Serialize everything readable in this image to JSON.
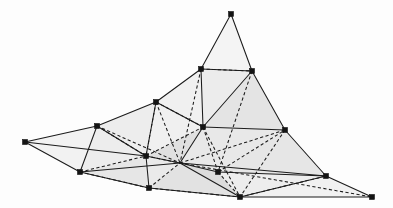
{
  "figure": {
    "canvas": {
      "width": 393,
      "height": 208
    },
    "style": {
      "background_color": "#fdfdfd",
      "face_fill_light": "#f4f4f4",
      "face_fill_mid": "#ebebeb",
      "face_fill_dark": "#e0e0e0",
      "face_fill_deep": "#d6d6d6",
      "edge_color": "#1b1b1b",
      "vertex_color": "#141414",
      "vertex_marker_shape": "square",
      "vertex_marker_size": 5,
      "visible_edge_style": "solid",
      "hidden_edge_style": "dashed"
    }
  },
  "chart_data": {
    "type": "scatter",
    "xlabel": "",
    "ylabel": "",
    "xlim": [
      0,
      393
    ],
    "ylim": [
      208,
      0
    ],
    "grid": false,
    "legend": "none",
    "vertices": [
      {
        "id": "v0",
        "label": "left-tip",
        "x": 25,
        "y": 142,
        "marked": true
      },
      {
        "id": "v1",
        "label": "upper-left",
        "x": 97,
        "y": 126,
        "marked": true
      },
      {
        "id": "v2",
        "label": "lower-left",
        "x": 80,
        "y": 172,
        "marked": true
      },
      {
        "id": "v3",
        "label": "ridge-left",
        "x": 156,
        "y": 102,
        "marked": true
      },
      {
        "id": "v4",
        "label": "mid-left",
        "x": 146,
        "y": 156,
        "marked": true
      },
      {
        "id": "v5",
        "label": "bottom-left",
        "x": 149,
        "y": 188,
        "marked": true
      },
      {
        "id": "v6",
        "label": "peak-left-base",
        "x": 201,
        "y": 69,
        "marked": true
      },
      {
        "id": "v7",
        "label": "apex",
        "x": 231,
        "y": 14,
        "marked": true
      },
      {
        "id": "v8",
        "label": "peak-right-base",
        "x": 252,
        "y": 71,
        "marked": true
      },
      {
        "id": "v9",
        "label": "center",
        "x": 203,
        "y": 127,
        "marked": true
      },
      {
        "id": "v10",
        "label": "hub",
        "x": 180,
        "y": 163,
        "marked": false
      },
      {
        "id": "v11",
        "label": "mid-right",
        "x": 218,
        "y": 172,
        "marked": true
      },
      {
        "id": "v12",
        "label": "bottom-center",
        "x": 240,
        "y": 197,
        "marked": true
      },
      {
        "id": "v13",
        "label": "right-upper",
        "x": 285,
        "y": 130,
        "marked": true
      },
      {
        "id": "v14",
        "label": "right-lower",
        "x": 326,
        "y": 176,
        "marked": true
      },
      {
        "id": "v15",
        "label": "right-tip",
        "x": 372,
        "y": 197,
        "marked": true
      }
    ],
    "faces": [
      {
        "id": "f0",
        "vertices": [
          "v0",
          "v1",
          "v2"
        ],
        "fill": "#f2f2f2"
      },
      {
        "id": "f1",
        "vertices": [
          "v1",
          "v3",
          "v4",
          "v2"
        ],
        "fill": "#ededed"
      },
      {
        "id": "f2",
        "vertices": [
          "v2",
          "v4",
          "v5"
        ],
        "fill": "#e6e6e6"
      },
      {
        "id": "f3",
        "vertices": [
          "v3",
          "v6",
          "v9",
          "v4"
        ],
        "fill": "#f0f0f0"
      },
      {
        "id": "f4",
        "vertices": [
          "v6",
          "v7",
          "v8"
        ],
        "fill": "#f4f4f4"
      },
      {
        "id": "f5",
        "vertices": [
          "v6",
          "v8",
          "v9"
        ],
        "fill": "#ececec"
      },
      {
        "id": "f6",
        "vertices": [
          "v8",
          "v13",
          "v9"
        ],
        "fill": "#e4e4e4"
      },
      {
        "id": "f7",
        "vertices": [
          "v4",
          "v9",
          "v10"
        ],
        "fill": "#e0e0e0"
      },
      {
        "id": "f8",
        "vertices": [
          "v4",
          "v10",
          "v5"
        ],
        "fill": "#eaeaea"
      },
      {
        "id": "f9",
        "vertices": [
          "v5",
          "v10",
          "v12"
        ],
        "fill": "#e2e2e2"
      },
      {
        "id": "f10",
        "vertices": [
          "v10",
          "v11",
          "v12"
        ],
        "fill": "#dcdcdc"
      },
      {
        "id": "f11",
        "vertices": [
          "v9",
          "v13",
          "v11",
          "v10"
        ],
        "fill": "#e8e8e8"
      },
      {
        "id": "f12",
        "vertices": [
          "v11",
          "v13",
          "v14"
        ],
        "fill": "#e6e6e6"
      },
      {
        "id": "f13",
        "vertices": [
          "v12",
          "v11",
          "v14"
        ],
        "fill": "#ededed"
      },
      {
        "id": "f14",
        "vertices": [
          "v14",
          "v15",
          "v12"
        ],
        "fill": "#f1f1f1"
      }
    ],
    "edges_visible": [
      [
        "v0",
        "v1"
      ],
      [
        "v0",
        "v2"
      ],
      [
        "v1",
        "v3"
      ],
      [
        "v3",
        "v6"
      ],
      [
        "v6",
        "v7"
      ],
      [
        "v7",
        "v8"
      ],
      [
        "v8",
        "v13"
      ],
      [
        "v13",
        "v14"
      ],
      [
        "v14",
        "v15"
      ],
      [
        "v15",
        "v12"
      ],
      [
        "v12",
        "v5"
      ],
      [
        "v5",
        "v2"
      ],
      [
        "v2",
        "v1"
      ],
      [
        "v1",
        "v4"
      ],
      [
        "v4",
        "v5"
      ],
      [
        "v3",
        "v4"
      ],
      [
        "v9",
        "v10"
      ],
      [
        "v10",
        "v4"
      ],
      [
        "v10",
        "v12"
      ],
      [
        "v10",
        "v11"
      ],
      [
        "v11",
        "v14"
      ],
      [
        "v9",
        "v13"
      ],
      [
        "v6",
        "v9"
      ],
      [
        "v8",
        "v9"
      ],
      [
        "v10",
        "v14"
      ],
      [
        "v12",
        "v14"
      ],
      [
        "v6",
        "v8"
      ],
      [
        "v3",
        "v9"
      ],
      [
        "v2",
        "v10"
      ],
      [
        "v0",
        "v4"
      ]
    ],
    "edges_hidden": [
      [
        "v6",
        "v8"
      ],
      [
        "v3",
        "v9"
      ],
      [
        "v9",
        "v11"
      ],
      [
        "v9",
        "v12"
      ],
      [
        "v4",
        "v10"
      ],
      [
        "v1",
        "v4"
      ],
      [
        "v3",
        "v4"
      ],
      [
        "v2",
        "v5"
      ],
      [
        "v5",
        "v10"
      ],
      [
        "v11",
        "v13"
      ],
      [
        "v10",
        "v13"
      ],
      [
        "v12",
        "v14"
      ],
      [
        "v11",
        "v12"
      ],
      [
        "v4",
        "v9"
      ],
      [
        "v5",
        "v12"
      ],
      [
        "v2",
        "v4"
      ],
      [
        "v6",
        "v10"
      ],
      [
        "v8",
        "v11"
      ],
      [
        "v1",
        "v10"
      ],
      [
        "v3",
        "v10"
      ],
      [
        "v13",
        "v12"
      ],
      [
        "v10",
        "v15"
      ]
    ],
    "counts": {
      "vertices": 16,
      "marked_vertices": 15,
      "faces": 15
    }
  }
}
